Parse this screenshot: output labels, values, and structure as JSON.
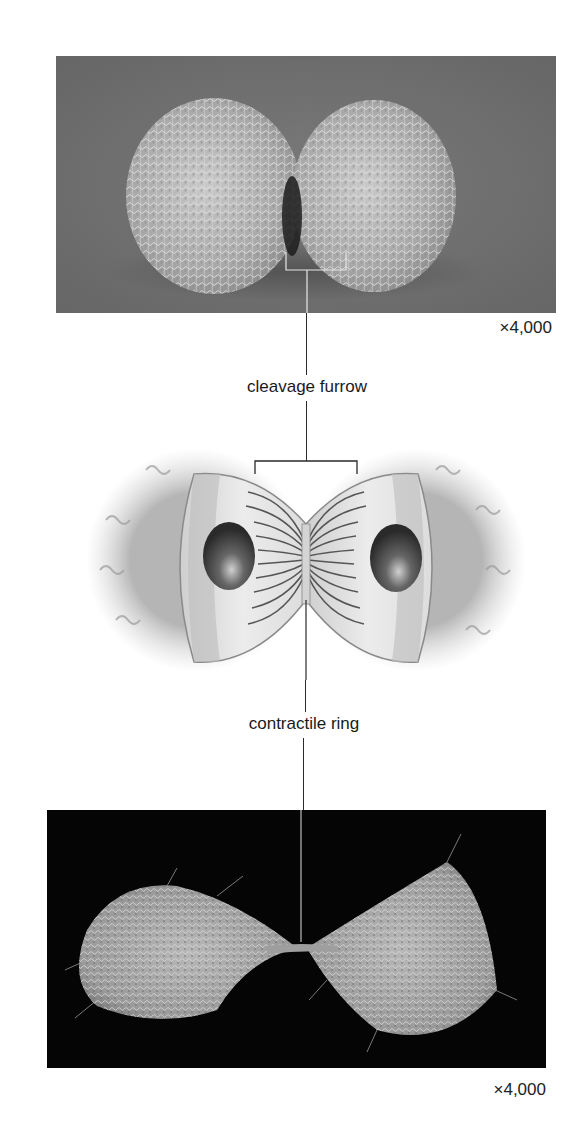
{
  "figure": {
    "top_micrograph": {
      "description": "scanning electron micrograph of a cell late in cleavage, two rounded halves covered in microvilli on gray background",
      "magnification": "×4,000"
    },
    "illustration": {
      "description": "cutaway drawing of dividing animal cell showing two nuclei and contractile ring actin filaments at the furrow"
    },
    "bottom_micrograph": {
      "description": "scanning electron micrograph of two daughter cells connected by thin cytoplasmic bridge on black background",
      "magnification": "×4,000"
    },
    "labels": {
      "cleavage_furrow": "cleavage furrow",
      "contractile_ring": "contractile ring"
    },
    "colors": {
      "top_bg": "#6e6e6e",
      "bottom_bg": "#050505",
      "line": "#2a2a2a"
    }
  }
}
